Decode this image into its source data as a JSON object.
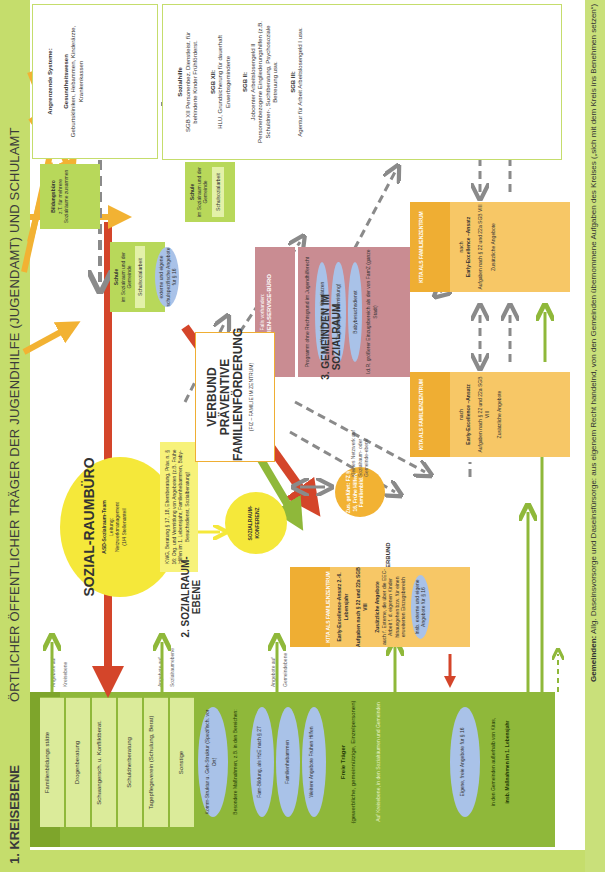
{
  "header": {
    "level1_title": "1. KREISEBENE",
    "level1_subtitle": "Hinweise zum Layout",
    "main_title": "ÖRTLICHER ÖFFENTLICHER TRÄGER DER JUGENDHILFE (JUGENDAMT) UND SCHULAMT"
  },
  "angrenzende": {
    "title": "Angrenzende Systeme:",
    "gesundheit_title": "Gesundheitswesen",
    "gesundheit_text": "Geburtskliniken, Hebammen, Kinderärzte, Krankenkassen",
    "sozialhilfe_title": "Sozialhilfe",
    "sozialhilfe_text": "SGB XII Personenbez. Dienstleist. für behinderte Kinder Frühförderst.",
    "sgb12_title": "SGB XII:",
    "sgb12_text": "HLU, Grundsicherung für dauerhaft Erwerbsgeminderte",
    "sgb2_title": "SGB II:",
    "sgb2_text": "Jobcenter Arbeitslosengeld II Personenbezogene Eingliederungshilfen (z.B. Schuldner-, Suchtberatung, Psychosoziale Betreuung usw.",
    "sgb3_title": "SGB III:",
    "sgb3_text": "Agentur für Arbeit Arbeitslosengeld I usw."
  },
  "bildungsbuero": {
    "title": "Bildungsbüro",
    "text": "z.T. für mehrere Sozialräume zusammen"
  },
  "schule_sozialraum": {
    "title": "Schule",
    "text": "im Sozialraum und der Gemeinde",
    "inner": "Schulsozialarbeit",
    "ellipse": "externe und eigene schulspezifische Angebote für § 16"
  },
  "schule_gemeinde": {
    "title": "Schule",
    "text": "im Sozialraum und der Gemeinde",
    "inner": "Schulsozialarbeit"
  },
  "familien_service": {
    "label_small": "Falls vorhanden:",
    "title": "FAMILIEN-SERVICE-BÜRO",
    "program": "Programm ohne Rechtsgrund im Jugendhilferecht",
    "ellipses": [
      "Vermittlung von Kitaplätzen",
      "Tagespflege (Vermittlung)",
      "Babybesuchsdienst"
    ],
    "footer": "I.d.R. größerer Einzugsbereich als der von FamZ (ganze Stadt)"
  },
  "sozialraumbuero": {
    "title": "SOZIAL-RAUMBÜRO",
    "team": "ASD-Sozialraum-Team",
    "leitung": "Leitung:",
    "netz": "Netzwerkmanagement",
    "anteil": "(1/4 Stellenanteil"
  },
  "kwg_box": "KWG, Beratung § 17, 18, Elternberatung, Präv. n. § 16: Org. und Vermittlung von Angeboten (z.B. Frühe Hilfen im 1. Lebensjahr, Familienhebammen, Baby-Besuchsdienst, Sozialberatung)",
  "konferenz": "SOZIALRAUM-KONFERENZ",
  "sun_small": "Zus. geführt: FZ § 16, Frühe Hilfen, Familienbild.",
  "kleines_netzwerk": "Kleines Netzwerk auf Sozialraum- oder Gemeinde-ebene",
  "verbund": {
    "title": "VERBUND PRÄVENTIVE FAMILIENFÖRDERUNG",
    "subtitle": "(FIZ – FAMILIE IM ZENTRUM)",
    "label": "VERBUND"
  },
  "level2": "2. SOZIALRAUM-EBENE",
  "level3": "3. GEMEINDEN IM SOZIALRAUM",
  "kita_main": {
    "roof": "KITA ALS FAMILIENZENTRUM",
    "eec": "Early-Excellence-Ansatz 2.-6. Lebensjahr",
    "aufgaben": "Aufgaben nach § 22 und 22a SGB VIII",
    "zus_title": "Zusätzliche Angebote",
    "zus_text": "auch f. Externe, die über die EEC-Arbeit f. d. eigenen Kinder hinausgehen bzw. für einen erweiterten Einzugsbereich",
    "ellipse": "Insb. externe und eigene Angebote für § 16"
  },
  "kita_small": [
    {
      "roof": "KITA ALS FAMILIENZENTRUM",
      "nach": "nach",
      "eec": "Early-Excellence –Ansatz",
      "aufgaben": "Aufgaben nach § 22 und 22a SGB VIII",
      "zus": "Zusätzliche Angebote"
    },
    {
      "roof": "KITA ALS FAMILIENZENTRUM",
      "nach": "nach",
      "eec": "Early-Excellence –Ansatz",
      "aufgaben": "Aufgaben nach § 22 und 22a SGB VIII",
      "zus": "Zusätzliche Angebote"
    }
  ],
  "angebote_labels": [
    {
      "a": "Angebote auf",
      "b": "Kreisebene"
    },
    {
      "a": "Angebote auf",
      "b": "Sozialraumebene"
    },
    {
      "a": "Angebote auf",
      "b": "Gemeindebene"
    }
  ],
  "freie_traeger": {
    "boxes": [
      "Familienbildungs stätte",
      "Drogenberatung",
      "Schwangersch. u. Konfliktberat.",
      "Schuldnerberatung",
      "Tagepflegeverein (Schulung, Berat)",
      "Sonstige"
    ],
    "ellipse_komm": "Komm-Struktur u. Geh-Struktur (Spezifisch. vor Ort)",
    "besondere": "Besondere Maßnahmen, z.B. in den Bereichen:",
    "ellipses": [
      "Fam-Bildung, als HzE nach § 27",
      "Familienhebammen",
      "Weitere Angebote Frühen Hilfen"
    ],
    "title": "Freie Träger",
    "text": "(gewerbliche, gemeinnützige, Einzelpersonen)",
    "note": "Auf Kreisebene, in den Sozialräumen und Gemeinden",
    "eigene": "Eigene, freie Angebote für § 16",
    "gemeinden_text": "in den Gemeinden außerhalb von Kitas,",
    "gemeinden_bold": "insb. Maßnahmen im 1. Lebensjahr"
  },
  "footer": {
    "bold": "Gemeinden:",
    "text": "Allg. Daseinsvorsorge und Daseinsfürsorge: aus eigenem Recht handelnd, von den Gemeinden übernommene Aufgaben des Kreises („sich mit dem Kreis ins Benehmen setzen“)"
  },
  "colors": {
    "green_band": "#c5dd6c",
    "green_dark": "#8fb83a",
    "yellow_sun": "#f5e83a",
    "orange_kita": "#f7c766",
    "roof_orange": "#efae33",
    "rose_fsb": "#c98c92",
    "blue_ellipse": "#a9c2e8",
    "red_arrow": "#d4452a",
    "arrow_orange": "#f2b233",
    "dash_gray": "#8a8a8a"
  }
}
